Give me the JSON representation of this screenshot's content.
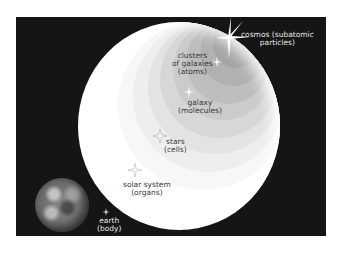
{
  "diagram": {
    "title": "",
    "background_color": "#151515",
    "circle_color": "#ffffff",
    "nodes": [
      {
        "id": "cosmos",
        "line1": "cosmos (subatomic",
        "line2": "particles)"
      },
      {
        "id": "clusters",
        "line1": "clusters",
        "line2": "of galaxies",
        "line3": "(atoms)"
      },
      {
        "id": "galaxy",
        "line1": "galaxy",
        "line2": "(molecules)"
      },
      {
        "id": "stars",
        "line1": "stars",
        "line2": "(cells)"
      },
      {
        "id": "solar_system",
        "line1": "solar system",
        "line2": "(organs)"
      },
      {
        "id": "earth",
        "line1": "earth",
        "line2": "(body)"
      }
    ],
    "ring_shades": [
      "#f6f6f6",
      "#eeeeee",
      "#e4e4e4",
      "#d9d9d9",
      "#cecece",
      "#c3c3c3",
      "#b8b8b8",
      "#adadad"
    ]
  }
}
